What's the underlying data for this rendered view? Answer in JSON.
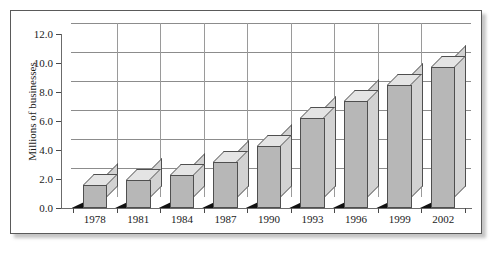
{
  "chart_data": {
    "type": "bar",
    "title": "",
    "subtitle": "",
    "xlabel": "",
    "ylabel": "Millions of businesses",
    "categories": [
      "1978",
      "1981",
      "1984",
      "1987",
      "1990",
      "1993",
      "1996",
      "1999",
      "2002"
    ],
    "values": [
      1.6,
      1.9,
      2.3,
      3.2,
      4.3,
      6.2,
      7.4,
      8.5,
      9.7
    ],
    "ylim": [
      0.0,
      12.0
    ],
    "ytick_labels": [
      "0.0",
      "2.0",
      "4.0",
      "6.0",
      "8.0",
      "10.0",
      "12.0"
    ],
    "ytick_values": [
      0.0,
      2.0,
      4.0,
      6.0,
      8.0,
      10.0,
      12.0
    ],
    "grid": true,
    "legend": false,
    "legend_position": "none",
    "style": "3d-column",
    "colors": {
      "bar_front": "#b7b7b7",
      "bar_top": "#e4e4e4",
      "bar_side": "#d2d2d2",
      "bar_outline": "#4f4f4f",
      "gridline": "#8c8c8c",
      "axis": "#6b6b6b",
      "base_shadow": "#111111",
      "frame": "#5a5a5a",
      "background": "#ffffff",
      "text": "#1a1a1a"
    }
  }
}
